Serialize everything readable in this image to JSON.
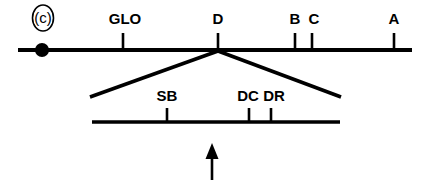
{
  "figure": {
    "panel_label": "(c)",
    "type": "genetic-linkage-map",
    "background_color": "#ffffff",
    "line_color": "#000000"
  },
  "main_map": {
    "name": "main-linkage-group",
    "line_start_x": 18,
    "line_end_x": 412,
    "line_y": 50,
    "centromere": {
      "label": "centromere",
      "x": 42,
      "y": 50,
      "radius": 7
    },
    "loci": [
      {
        "label": "GLO",
        "x": 123,
        "tick_top": 33,
        "tick_bottom": 50,
        "label_x": 125,
        "label_y": 24
      },
      {
        "label": "D",
        "x": 218,
        "tick_top": 33,
        "tick_bottom": 50,
        "label_x": 218,
        "label_y": 24
      },
      {
        "label": "B",
        "x": 295,
        "tick_top": 33,
        "tick_bottom": 50,
        "label_x": 295,
        "label_y": 24
      },
      {
        "label": "C",
        "x": 312,
        "tick_top": 33,
        "tick_bottom": 50,
        "label_x": 314,
        "label_y": 24
      },
      {
        "label": "A",
        "x": 394,
        "tick_top": 33,
        "tick_bottom": 50,
        "label_x": 394,
        "label_y": 24
      }
    ]
  },
  "expansion": {
    "name": "expanded-region",
    "apex_x": 218,
    "apex_y": 51,
    "left_foot_x": 90,
    "left_foot_y": 97,
    "right_foot_x": 341,
    "right_foot_y": 97
  },
  "sub_map": {
    "name": "expanded-sub-map",
    "line_start_x": 92,
    "line_end_x": 340,
    "line_y": 122,
    "loci": [
      {
        "label": "SB",
        "x": 167,
        "tick_top": 108,
        "tick_bottom": 122,
        "label_x": 167,
        "label_y": 101
      },
      {
        "label": "DC",
        "x": 249,
        "tick_top": 108,
        "tick_bottom": 122,
        "label_x": 248,
        "label_y": 101
      },
      {
        "label": "DR",
        "x": 271,
        "tick_top": 108,
        "tick_bottom": 122,
        "label_x": 274,
        "label_y": 101
      }
    ]
  },
  "pointer_arrow": {
    "name": "up-arrow-marker",
    "x": 212,
    "tip_y": 144,
    "tail_y": 180,
    "head_width": 13,
    "head_height": 15
  }
}
